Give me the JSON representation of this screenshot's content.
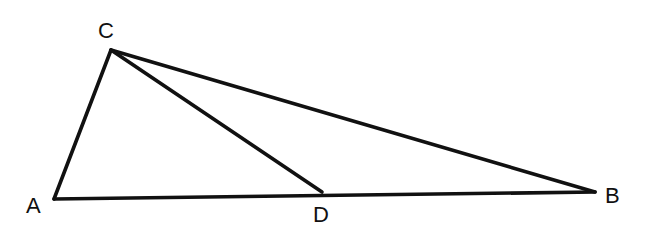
{
  "diagram": {
    "type": "geometry-triangle",
    "stroke_color": "#111111",
    "background": "#ffffff",
    "points": {
      "A": {
        "label": "A",
        "x": 54,
        "y": 199,
        "label_x": 26,
        "label_y": 213
      },
      "B": {
        "label": "B",
        "x": 595,
        "y": 192,
        "label_x": 605,
        "label_y": 203
      },
      "C": {
        "label": "C",
        "x": 111,
        "y": 50,
        "label_x": 98,
        "label_y": 38
      },
      "D": {
        "label": "D",
        "x": 322,
        "y": 192,
        "label_x": 313,
        "label_y": 222
      }
    },
    "segments": [
      {
        "name": "segment-ca",
        "from": "C",
        "to": "A"
      },
      {
        "name": "segment-ab",
        "from": "A",
        "to": "B"
      },
      {
        "name": "segment-cb",
        "from": "C",
        "to": "B"
      },
      {
        "name": "segment-cd",
        "from": "C",
        "to": "D"
      }
    ]
  }
}
